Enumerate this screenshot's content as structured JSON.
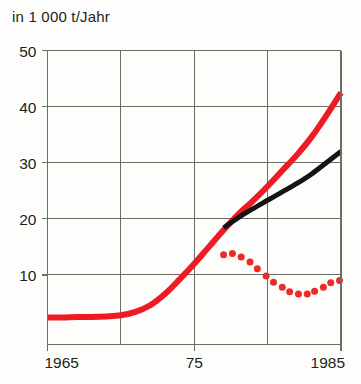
{
  "chart": {
    "title": "in 1 000 t/Jahr",
    "background_color": "#fdfdfb",
    "frame_color": "#6f6c66",
    "grid_color": "#6f6c66",
    "text_color": "#211f1d"
  },
  "axis": {
    "y_ticks": [
      "50",
      "40",
      "30",
      "20",
      "10"
    ],
    "x_ticks": [
      "1965",
      "75",
      "1985"
    ]
  },
  "chart_data": {
    "type": "line",
    "title": "in 1 000 t/Jahr",
    "xlabel": "",
    "ylabel": "in 1 000 t/Jahr",
    "xlim": [
      1965,
      1985
    ],
    "ylim": [
      0,
      50
    ],
    "yticks": [
      10,
      20,
      30,
      40,
      50
    ],
    "xticks": [
      1965,
      1975,
      1985
    ],
    "xtick_labels": [
      "1965",
      "75",
      "1985"
    ],
    "gridlines": {
      "horizontal_at": [
        10,
        20,
        30,
        40,
        50
      ],
      "vertical_at": [
        1970,
        1975,
        1980
      ]
    },
    "legend": "none",
    "series": [
      {
        "name": "total",
        "style": "solid",
        "color": "#ed1c24",
        "width": 6,
        "x": [
          1965,
          1966,
          1967,
          1968,
          1969,
          1970,
          1971,
          1972,
          1973,
          1974,
          1975,
          1976,
          1977,
          1978,
          1979,
          1980,
          1981,
          1982,
          1983,
          1984,
          1985
        ],
        "values": [
          2.4,
          2.4,
          2.5,
          2.5,
          2.6,
          2.8,
          3.4,
          4.6,
          6.6,
          9.2,
          12.0,
          15.0,
          18.0,
          20.8,
          23.2,
          25.8,
          28.6,
          31.4,
          34.6,
          38.4,
          42.5
        ]
      },
      {
        "name": "secondary",
        "style": "solid",
        "color": "#141414",
        "width": 5,
        "x": [
          1977,
          1978,
          1979,
          1980,
          1981,
          1982,
          1983,
          1984,
          1985
        ],
        "values": [
          18.4,
          20.2,
          21.8,
          23.3,
          24.8,
          26.3,
          28.0,
          30.0,
          32.0
        ]
      },
      {
        "name": "difference",
        "style": "dotted",
        "color": "#ee2a29",
        "marker": "circle",
        "marker_size": 7,
        "x": [
          1977,
          1977.6,
          1978.2,
          1978.8,
          1979.3,
          1979.9,
          1980.4,
          1981.0,
          1981.5,
          1982.1,
          1982.7,
          1983.2,
          1983.8,
          1984.3,
          1984.9
        ],
        "values": [
          13.6,
          13.8,
          13.2,
          12.3,
          11.1,
          9.8,
          8.7,
          7.8,
          7.0,
          6.6,
          6.6,
          7.1,
          7.8,
          8.6,
          9.0
        ]
      }
    ]
  }
}
